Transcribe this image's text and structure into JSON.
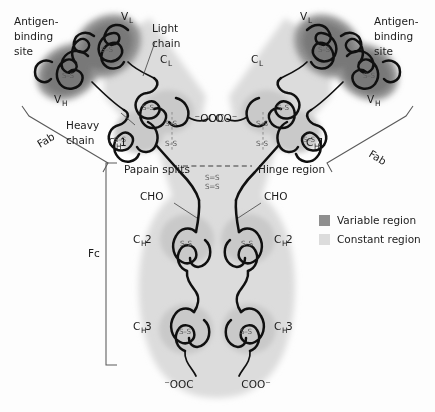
{
  "figure": {
    "background": "#fdfdfd"
  },
  "colors": {
    "variable_region": "#8f8f8f",
    "variable_core": "#7a7a7a",
    "constant_region": "#dcdcdc",
    "constant_domain": "#c9c9c9",
    "chain_outline": "#101010",
    "bracket": "#5a5a5a",
    "disulfide": "#8d8d8d",
    "text": "#1b1b1b"
  },
  "labels": {
    "antigen_site_left": "Antigen-\nbinding\nsite",
    "antigen_site_left_l1": "Antigen-",
    "antigen_site_left_l2": "binding",
    "antigen_site_left_l3": "site",
    "antigen_site_right_l1": "Antigen-",
    "antigen_site_right_l2": "binding",
    "antigen_site_right_l3": "site",
    "light_chain_l1": "Light",
    "light_chain_l2": "chain",
    "heavy_chain_l1": "Heavy",
    "heavy_chain_l2": "chain",
    "papain_splits": "Papain splits",
    "hinge_region": "Hinge region",
    "cho_left": "CHO",
    "cho_right": "CHO",
    "fab_left": "Fab",
    "fab_right": "Fab",
    "fc": "Fc"
  },
  "domains": {
    "v_l_left": {
      "base": "V",
      "sub": "L"
    },
    "v_l_right": {
      "base": "V",
      "sub": "L"
    },
    "v_h_left": {
      "base": "V",
      "sub": "H"
    },
    "v_h_right": {
      "base": "V",
      "sub": "H"
    },
    "c_l_left": {
      "base": "C",
      "sub": "L"
    },
    "c_l_right": {
      "base": "C",
      "sub": "L"
    },
    "c_h1_left": {
      "base": "C",
      "sub": "H",
      "num": "1"
    },
    "c_h1_right": {
      "base": "C",
      "sub": "H",
      "num": "1"
    },
    "c_h2_left": {
      "base": "C",
      "sub": "H",
      "num": "2"
    },
    "c_h2_right": {
      "base": "C",
      "sub": "H",
      "num": "2"
    },
    "c_h3_left": {
      "base": "C",
      "sub": "H",
      "num": "3"
    },
    "c_h3_right": {
      "base": "C",
      "sub": "H",
      "num": "3"
    }
  },
  "termini": {
    "light_coo_left": "COO⁻",
    "light_coo_right": "⁻OOC",
    "heavy_coo_left": "⁻OOC",
    "heavy_coo_right": "COO⁻"
  },
  "disulfides": {
    "label": "S–S",
    "hinge_upper": "S=S",
    "hinge_lower": "S=S",
    "count_intrachain": 12,
    "count_hinge": 2,
    "count_interchain_hl": 2
  },
  "legend": {
    "items": [
      {
        "label": "Variable region",
        "color": "#8f8f8f"
      },
      {
        "label": "Constant region",
        "color": "#dcdcdc"
      }
    ]
  }
}
